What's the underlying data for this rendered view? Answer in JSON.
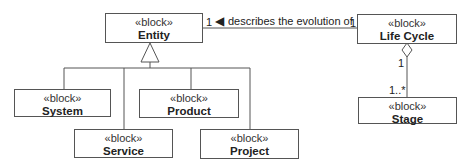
{
  "diagram": {
    "type": "SysML block definition diagram",
    "stereotype": "«block»",
    "blocks": {
      "entity": {
        "stereotype": "«block»",
        "name": "Entity"
      },
      "system": {
        "stereotype": "«block»",
        "name": "System"
      },
      "service": {
        "stereotype": "«block»",
        "name": "Service"
      },
      "product": {
        "stereotype": "«block»",
        "name": "Product"
      },
      "project": {
        "stereotype": "«block»",
        "name": "Project"
      },
      "life_cycle": {
        "stereotype": "«block»",
        "name": "Life Cycle"
      },
      "stage": {
        "stereotype": "«block»",
        "name": "Stage"
      }
    },
    "association": {
      "label": "describes the evolution of",
      "direction_arrow": "◀",
      "mult_entity": "1",
      "mult_life_cycle": "1"
    },
    "aggregation": {
      "mult_whole": "1",
      "mult_part": "1..*"
    },
    "generalization": {
      "parent": "Entity",
      "children": [
        "System",
        "Service",
        "Product",
        "Project"
      ]
    },
    "colors": {
      "line": "#555555",
      "text": "#222222",
      "background": "#ffffff"
    }
  }
}
